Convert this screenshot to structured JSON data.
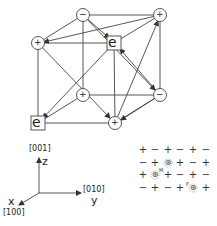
{
  "cube": {
    "nodes": [
      {
        "id": "top-back-left",
        "label": "−",
        "shape": "circle",
        "x": 83,
        "y": 15
      },
      {
        "id": "top-back-right",
        "label": "+",
        "shape": "circle",
        "x": 160,
        "y": 15
      },
      {
        "id": "top-front-left",
        "label": "+",
        "shape": "circle",
        "x": 38,
        "y": 43
      },
      {
        "id": "top-front-right",
        "label": "e",
        "shape": "square",
        "x": 114,
        "y": 43
      },
      {
        "id": "bottom-back-left",
        "label": "+",
        "shape": "circle",
        "x": 83,
        "y": 95
      },
      {
        "id": "bottom-back-right",
        "label": "−",
        "shape": "circle",
        "x": 160,
        "y": 95
      },
      {
        "id": "bottom-front-left",
        "label": "e",
        "shape": "square",
        "x": 38,
        "y": 123
      },
      {
        "id": "bottom-front-right",
        "label": "+",
        "shape": "circle",
        "x": 115,
        "y": 123
      }
    ]
  },
  "axes": {
    "z_index": "[001]",
    "z_label": "z",
    "y_index": "[010]",
    "y_label": "y",
    "x_index": "[100]",
    "x_label": "x"
  },
  "lattice": {
    "rows": [
      [
        "+",
        "−",
        "+",
        "−",
        "+",
        "−"
      ],
      [
        "−",
        "+",
        "⊛",
        "+",
        "−",
        "+"
      ],
      [
        "+",
        "⊛",
        "+",
        "−",
        "+",
        "−"
      ],
      [
        "−",
        "+",
        "−",
        "+",
        "⊛",
        "+"
      ]
    ],
    "annotations": [
      {
        "text": "M",
        "row": 2,
        "col": 1
      },
      {
        "text": "F",
        "row": 3,
        "col": 4
      }
    ]
  }
}
